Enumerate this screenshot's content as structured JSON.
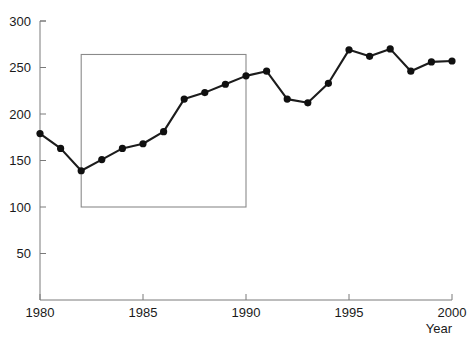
{
  "chart_data": {
    "type": "line",
    "title": "",
    "subtitle": "",
    "xlabel": "Year",
    "ylabel": "",
    "x": [
      1980,
      1981,
      1982,
      1983,
      1984,
      1985,
      1986,
      1987,
      1988,
      1989,
      1990,
      1991,
      1992,
      1993,
      1994,
      1995,
      1996,
      1997,
      1998,
      1999,
      2000
    ],
    "values": [
      179,
      163,
      139,
      151,
      163,
      168,
      181,
      216,
      223,
      232,
      241,
      246,
      216,
      212,
      233,
      269,
      262,
      270,
      246,
      256,
      257
    ],
    "series": [
      {
        "name": "series-1",
        "values": [
          179,
          163,
          139,
          151,
          163,
          168,
          181,
          216,
          223,
          232,
          241,
          246,
          216,
          212,
          233,
          269,
          262,
          270,
          246,
          256,
          257
        ]
      }
    ],
    "xlim": [
      1980,
      2000
    ],
    "ylim": [
      0,
      300
    ],
    "xticks": [
      1980,
      1985,
      1990,
      1995,
      2000
    ],
    "xtick_labels": [
      "1980",
      "1985",
      "1990",
      "1995",
      "2000"
    ],
    "yticks": [
      50,
      100,
      150,
      200,
      250,
      300
    ],
    "ytick_labels": [
      "50",
      "100",
      "150",
      "200",
      "250",
      "300"
    ],
    "grid": false,
    "legend": null,
    "legend_position": "none",
    "marker": "circle",
    "line_color": "#1c1c1c",
    "marker_color": "#101010",
    "axis_color": "#7a7a7a",
    "annotations": [
      {
        "name": "highlight-rectangle",
        "type": "rect",
        "x0": 1982,
        "x1": 1990,
        "y0": 100,
        "y1": 264,
        "stroke": "#8a8a8a",
        "fill": "none"
      }
    ]
  },
  "axes": {
    "x_axis_title": "Year",
    "y_axis_title": ""
  }
}
